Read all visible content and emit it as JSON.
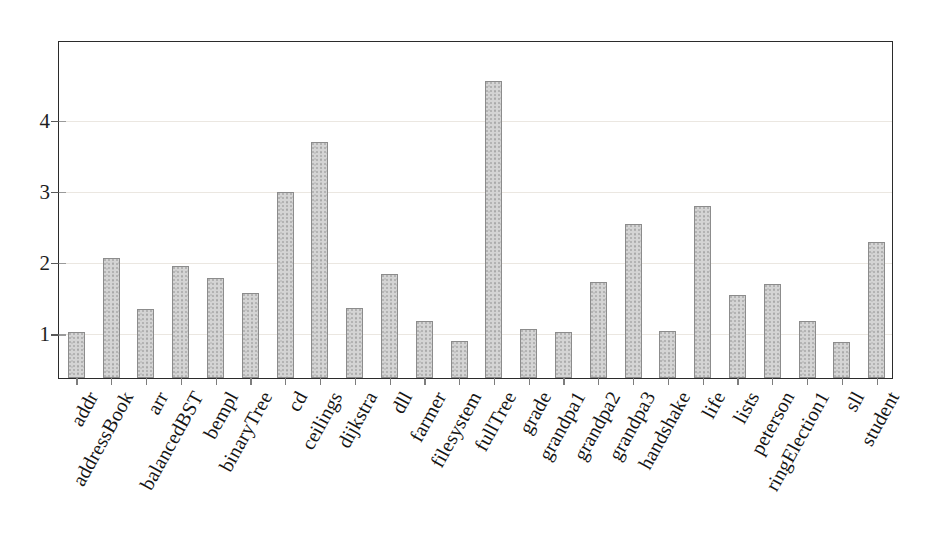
{
  "chart_data": {
    "type": "bar",
    "title": "",
    "subtitle": "",
    "xlabel": "",
    "ylabel": "",
    "categories": [
      "addr",
      "addressBook",
      "arr",
      "balancedBST",
      "bempl",
      "binaryTree",
      "cd",
      "ceilings",
      "dijkstra",
      "dll",
      "farmer",
      "filesystem",
      "fullTree",
      "grade",
      "grandpa1",
      "grandpa2",
      "grandpa3",
      "handshake",
      "life",
      "lists",
      "peterson",
      "ringElection1",
      "sll",
      "student"
    ],
    "values": [
      1.0,
      2.05,
      1.33,
      1.93,
      1.77,
      1.56,
      2.97,
      3.67,
      1.35,
      1.82,
      1.16,
      0.88,
      4.53,
      1.05,
      1.0,
      1.71,
      2.52,
      1.02,
      2.78,
      1.53,
      1.68,
      1.16,
      0.87,
      2.27
    ],
    "ytick_labels": [
      "1",
      "2",
      "3",
      "4"
    ],
    "ytick_values": [
      1,
      2,
      3,
      4
    ],
    "ylim": [
      0.36,
      5.11
    ],
    "grid": true,
    "grid_axis": "y",
    "legend": "none",
    "bar_color": "#d4d4d4",
    "bar_edge_color": "#8c8c8c",
    "axis_color": "#2b2b2b",
    "grid_color": "#ebe7e1",
    "xtick_rotation_deg": -61
  }
}
